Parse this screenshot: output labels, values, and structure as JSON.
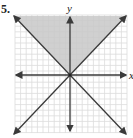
{
  "problem_number": "5.",
  "chart_data": {
    "type": "line",
    "title": "",
    "xlabel": "x",
    "ylabel": "y",
    "xlim": [
      -10,
      10
    ],
    "ylim": [
      -10,
      10
    ],
    "grid": true,
    "series": [
      {
        "name": "y = x",
        "x": [
          -10,
          10
        ],
        "y": [
          -10,
          10
        ],
        "style": "solid",
        "arrows": true
      },
      {
        "name": "y = -x",
        "x": [
          -10,
          10
        ],
        "y": [
          10,
          -10
        ],
        "style": "solid",
        "arrows": true
      }
    ],
    "shaded_region": {
      "description": "y >= |x|",
      "vertices": [
        [
          -10,
          10
        ],
        [
          10,
          10
        ],
        [
          0,
          0
        ]
      ],
      "color": "#c8c8c8"
    },
    "colors": {
      "line": "#3a3a3a",
      "grid": "#dcdcdc",
      "shade": "#c8c8c8"
    }
  }
}
